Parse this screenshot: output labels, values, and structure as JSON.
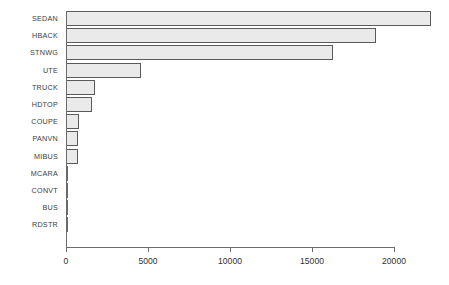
{
  "chart_data": {
    "type": "bar",
    "orientation": "horizontal",
    "title": "",
    "subtitle": "",
    "xlabel": "",
    "ylabel": "",
    "xlim": [
      0,
      22500
    ],
    "ylim": null,
    "grid": false,
    "legend": null,
    "categories": [
      "SEDAN",
      "HBACK",
      "STNWG",
      "UTE",
      "TRUCK",
      "HDTOP",
      "COUPE",
      "PANVN",
      "MIBUS",
      "MCARA",
      "CONVT",
      "BUS",
      "RDSTR"
    ],
    "values": [
      22233,
      18915,
      16261,
      4586,
      1750,
      1579,
      780,
      752,
      717,
      121,
      60,
      48,
      27
    ],
    "xticks": [
      0,
      5000,
      10000,
      15000,
      20000
    ],
    "xtick_labels": [
      "0",
      "5000",
      "10000",
      "15000",
      "20000"
    ],
    "series": [
      {
        "name": "count",
        "values": [
          22233,
          18915,
          16261,
          4586,
          1750,
          1579,
          780,
          752,
          717,
          121,
          60,
          48,
          27
        ]
      }
    ],
    "bar_fill_color": "#eaeaea",
    "bar_border_color": "#5a5a5a",
    "axis_color": "#6b6b6b",
    "text_color": "#3d3d3d",
    "background_color": "#ffffff"
  },
  "axis": {
    "ticks": [
      {
        "value": 0,
        "label": "0"
      },
      {
        "value": 5000,
        "label": "5000"
      },
      {
        "value": 10000,
        "label": "10000"
      },
      {
        "value": 15000,
        "label": "15000"
      },
      {
        "value": 20000,
        "label": "20000"
      }
    ]
  },
  "bars": [
    {
      "label": "SEDAN",
      "value": 22233
    },
    {
      "label": "HBACK",
      "value": 18915
    },
    {
      "label": "STNWG",
      "value": 16261
    },
    {
      "label": "UTE",
      "value": 4586
    },
    {
      "label": "TRUCK",
      "value": 1750
    },
    {
      "label": "HDTOP",
      "value": 1579
    },
    {
      "label": "COUPE",
      "value": 780
    },
    {
      "label": "PANVN",
      "value": 752
    },
    {
      "label": "MIBUS",
      "value": 717
    },
    {
      "label": "MCARA",
      "value": 121
    },
    {
      "label": "CONVT",
      "value": 60
    },
    {
      "label": "BUS",
      "value": 48
    },
    {
      "label": "RDSTR",
      "value": 27
    }
  ]
}
